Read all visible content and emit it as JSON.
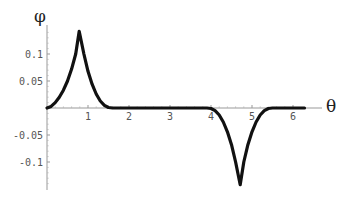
{
  "chart_data": {
    "type": "line",
    "title": "",
    "xlabel": "θ",
    "ylabel": "φ",
    "xlim": [
      0,
      6.3
    ],
    "ylim": [
      -0.15,
      0.15
    ],
    "grid": false,
    "legend": null,
    "xticks": [
      "1",
      "2",
      "3",
      "4",
      "5",
      "6"
    ],
    "yticks": [
      "0.1",
      "0.05",
      "-0.05",
      "-0.1"
    ],
    "series": [
      {
        "name": "φ(θ)",
        "color": "#111111",
        "x": [
          0,
          0.1,
          0.2,
          0.3,
          0.4,
          0.5,
          0.6,
          0.7,
          0.785,
          0.9,
          1.0,
          1.1,
          1.2,
          1.3,
          1.4,
          1.5,
          1.6,
          2.0,
          3.0,
          3.9,
          4.0,
          4.1,
          4.2,
          4.3,
          4.4,
          4.5,
          4.6,
          4.712,
          4.8,
          4.9,
          5.0,
          5.1,
          5.2,
          5.3,
          5.4,
          5.5,
          6.0,
          6.28
        ],
        "y": [
          0,
          0.003,
          0.01,
          0.02,
          0.033,
          0.05,
          0.072,
          0.1,
          0.142,
          0.1,
          0.068,
          0.044,
          0.026,
          0.013,
          0.005,
          0.001,
          0,
          0,
          0,
          0,
          -0.001,
          -0.005,
          -0.013,
          -0.026,
          -0.044,
          -0.068,
          -0.1,
          -0.142,
          -0.1,
          -0.068,
          -0.044,
          -0.026,
          -0.013,
          -0.005,
          -0.001,
          0,
          0,
          0
        ]
      }
    ]
  }
}
